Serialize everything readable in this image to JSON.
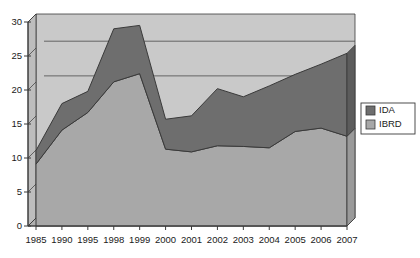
{
  "chart_data": {
    "type": "area",
    "stacked": true,
    "title": "",
    "xlabel": "",
    "ylabel": "",
    "categories": [
      "1985",
      "1990",
      "1995",
      "1998",
      "1999",
      "2000",
      "2001",
      "2002",
      "2003",
      "2004",
      "2005",
      "2006",
      "2007"
    ],
    "series": [
      {
        "name": "IBRD",
        "color": "#a8a8a8",
        "values": [
          9.1,
          14.1,
          16.7,
          21.2,
          22.4,
          11.3,
          10.9,
          11.8,
          11.7,
          11.5,
          13.9,
          14.4,
          13.2
        ]
      },
      {
        "name": "IDA",
        "color": "#6e6e6e",
        "values": [
          2.0,
          3.9,
          3.1,
          7.8,
          7.1,
          4.4,
          5.3,
          8.4,
          7.3,
          9.1,
          8.4,
          9.4,
          12.2
        ]
      }
    ],
    "totals": [
      11.1,
      18.0,
      19.8,
      29.0,
      29.5,
      15.7,
      16.2,
      20.2,
      19.0,
      20.6,
      22.3,
      23.8,
      25.4
    ],
    "yticks": [
      0,
      5,
      10,
      15,
      20,
      25,
      30
    ],
    "ylim": [
      0,
      30
    ],
    "gridlines": [
      20.9,
      26.0
    ],
    "grid": true,
    "legend": {
      "position": "right",
      "entries": [
        {
          "label": "IDA",
          "color": "#6e6e6e"
        },
        {
          "label": "IBRD",
          "color": "#a8a8a8"
        }
      ]
    },
    "style": {
      "plot_background": "#b5b5b5",
      "wall_background": "#c9c9c9",
      "border": "#3a3a3a",
      "text": "#1a1a1a"
    }
  }
}
